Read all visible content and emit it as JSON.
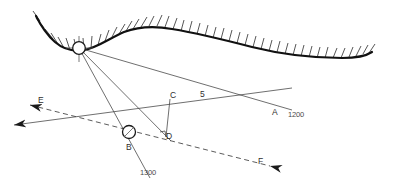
{
  "figure": {
    "kind": "survey-section-diagram",
    "background_color": "#ffffff",
    "line_color": "#3f3f3f",
    "terrain_color": "#111111"
  },
  "labels": {
    "point_a": "A",
    "point_b": "B",
    "point_c": "C",
    "point_d": "D",
    "vector_e": "E",
    "vector_e2": "E",
    "vector_f": "F",
    "dim_5": "5",
    "elev_1200": "1200",
    "elev_1300": "1300"
  },
  "stations": [
    {
      "name": "top-station",
      "label": "",
      "cx": 79,
      "cy": 48,
      "r": 6.5,
      "marker": "crosshair"
    },
    {
      "name": "station-b",
      "label": "B",
      "cx": 129,
      "cy": 132,
      "r": 6.5,
      "marker": "slash"
    }
  ],
  "geometry": {
    "terrain_path": "M 36,16 C 40,24 46,34 55,42 C 63,49 72,52 84,50 C 97,48 110,38 124,32 C 140,26 156,26 172,29 C 196,33 225,40 252,47 C 280,54 312,58 342,58 C 356,58 366,56 372,52",
    "hatch_count": 46,
    "rays": [
      {
        "name": "ray-top-to-a",
        "from": [
          79,
          48
        ],
        "to": [
          292,
          110
        ],
        "style": "solid"
      },
      {
        "name": "ray-top-to-b",
        "from": [
          79,
          48
        ],
        "to": [
          148,
          175
        ],
        "style": "solid"
      },
      {
        "name": "ray-top-to-d",
        "from": [
          79,
          48
        ],
        "to": [
          170,
          140
        ],
        "style": "solid"
      },
      {
        "name": "ray-left-to-right",
        "from": [
          6,
          127
        ],
        "to": [
          292,
          88
        ],
        "style": "solid"
      },
      {
        "name": "ray-dashed-e-f",
        "from": [
          22,
          103
        ],
        "to": [
          277,
          168
        ],
        "style": "dashed"
      },
      {
        "name": "segment-c-d",
        "from": [
          170,
          99
        ],
        "to": [
          166,
          137
        ],
        "style": "solid"
      }
    ],
    "arrows": [
      {
        "name": "arrow-e-dashed",
        "tip": [
          22,
          103
        ],
        "dir": "left",
        "style": "dashed"
      },
      {
        "name": "arrow-left-solid",
        "tip": [
          6,
          127
        ],
        "dir": "left",
        "style": "solid"
      },
      {
        "name": "arrow-f-dashed",
        "tip": [
          277,
          168
        ],
        "dir": "right",
        "style": "dashed"
      }
    ]
  }
}
